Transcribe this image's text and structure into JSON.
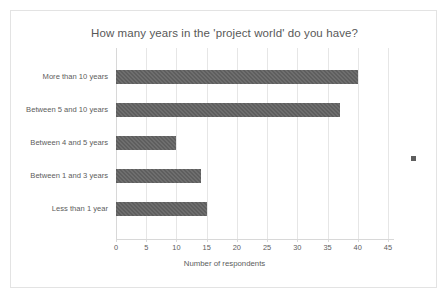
{
  "chart_data": {
    "type": "bar",
    "orientation": "horizontal",
    "title": "How many years in the 'project world' do you have?",
    "xlabel": "Number of respondents",
    "ylabel": "",
    "categories": [
      "More than 10 years",
      "Between 5 and 10 years",
      "Between 4 and 5 years",
      "Between 1 and 3 years",
      "Less than 1 year"
    ],
    "values": [
      40,
      37,
      10,
      14,
      15
    ],
    "xticks": [
      0,
      5,
      10,
      15,
      20,
      25,
      30,
      35,
      40,
      45
    ],
    "xtick_labels": [
      "0",
      "5",
      "10",
      "15",
      "20",
      "25",
      "30",
      "35",
      "40",
      "45"
    ],
    "xlim": [
      0,
      46
    ],
    "grid": true,
    "legend": false,
    "bar_color": "#5e5e5e",
    "text_color": "#5c5c5c",
    "grid_color": "#e6e6e6",
    "border_color": "#e3e3e3",
    "background": "#ffffff"
  },
  "marker": {
    "name": "legend-marker",
    "color": "#5e5e5e"
  }
}
